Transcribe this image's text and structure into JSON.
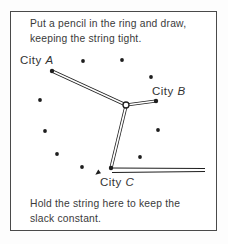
{
  "figure": {
    "captions": {
      "top": [
        "Put a pencil in the ring and draw,",
        "keeping the string tight."
      ],
      "bottom": [
        "Hold the string here to keep the",
        "slack constant."
      ]
    },
    "colors": {
      "ink": "#3a3a3a",
      "line": "#1e1e1e",
      "frame_border": "#4a4a4a",
      "background": "#ffffff",
      "page_background": "#fdfdfd"
    }
  },
  "diagram": {
    "labels": [
      {
        "prefix": "City ",
        "name": "A",
        "x": 20,
        "y": 54
      },
      {
        "prefix": "City ",
        "name": "B",
        "x": 152,
        "y": 85
      },
      {
        "prefix": "City ",
        "name": "C",
        "x": 100,
        "y": 176
      }
    ],
    "dots": [
      [
        83,
        61
      ],
      [
        122,
        60
      ],
      [
        151,
        77
      ],
      [
        40,
        100
      ],
      [
        45,
        131
      ],
      [
        57,
        154
      ],
      [
        82,
        167
      ],
      [
        158,
        130
      ],
      [
        140,
        157
      ]
    ],
    "city_points": [
      [
        52,
        71
      ],
      [
        156,
        101
      ],
      [
        111,
        168
      ]
    ],
    "ring": {
      "cx": 126,
      "cy": 105,
      "r": 3
    },
    "strings_double": [
      [
        52,
        71,
        126,
        105
      ],
      [
        126,
        105,
        156,
        101
      ],
      [
        126,
        106,
        111,
        168
      ]
    ],
    "strings_single": [
      [
        111,
        168,
        205,
        168.5
      ],
      [
        112,
        172.5,
        205,
        171.5
      ]
    ],
    "pointer_arrow": [
      [
        95.3,
        174.8
      ],
      [
        101.0,
        173.3
      ],
      [
        98.3,
        169.6
      ]
    ]
  }
}
